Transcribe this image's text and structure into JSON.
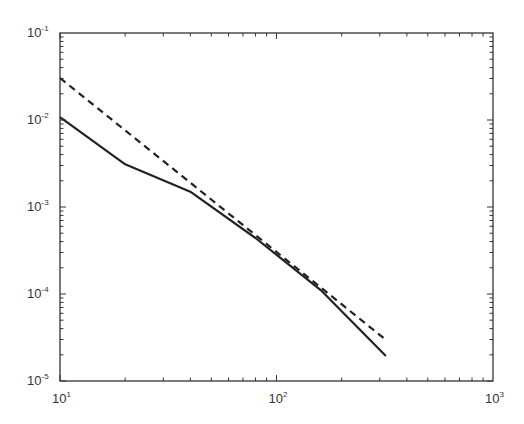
{
  "chart_data": {
    "type": "line",
    "title": "",
    "xlabel": "",
    "ylabel": "",
    "xscale": "log",
    "yscale": "log",
    "xlim": [
      10,
      1000
    ],
    "ylim": [
      1e-05,
      0.1
    ],
    "grid": false,
    "legend": null,
    "x_ticks": [
      {
        "base": "10",
        "exp": "1",
        "value": 10
      },
      {
        "base": "10",
        "exp": "2",
        "value": 100
      },
      {
        "base": "10",
        "exp": "3",
        "value": 1000
      }
    ],
    "y_ticks": [
      {
        "base": "10",
        "exp": "-1",
        "value": 0.1
      },
      {
        "base": "10",
        "exp": "-2",
        "value": 0.01
      },
      {
        "base": "10",
        "exp": "-3",
        "value": 0.001
      },
      {
        "base": "10",
        "exp": "-4",
        "value": 0.0001
      },
      {
        "base": "10",
        "exp": "-5",
        "value": 1e-05
      }
    ],
    "series": [
      {
        "name": "solid",
        "style": "solid",
        "color": "#222222",
        "x": [
          10,
          20,
          40,
          80,
          160,
          320
        ],
        "y": [
          0.0108,
          0.0031,
          0.0015,
          0.00044,
          0.000111,
          1.94e-05
        ]
      },
      {
        "name": "dashed",
        "style": "dashed",
        "color": "#222222",
        "x": [
          10,
          20,
          40,
          80,
          160,
          320
        ],
        "y": [
          0.0304,
          0.0076,
          0.0019,
          0.000475,
          0.000119,
          2.97e-05
        ]
      }
    ]
  },
  "layout": {
    "plot": {
      "left": 60,
      "top": 33,
      "right": 493,
      "bottom": 381
    }
  }
}
